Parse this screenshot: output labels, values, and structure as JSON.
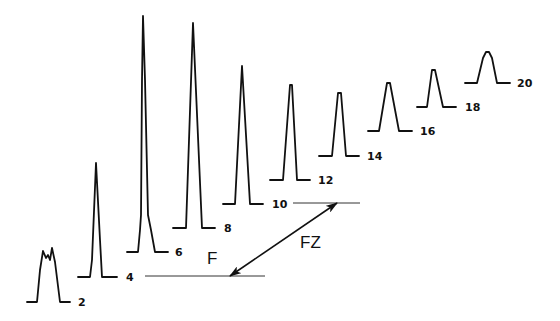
{
  "diagram": {
    "colors": {
      "ink": "#111111",
      "background": "#ffffff"
    },
    "peaks": [
      {
        "label": "2",
        "baseline_y": 302,
        "points": [
          [
            27,
            302
          ],
          [
            37,
            302
          ],
          [
            40,
            270
          ],
          [
            43,
            251
          ],
          [
            46,
            258
          ],
          [
            48,
            255
          ],
          [
            50,
            260
          ],
          [
            52,
            248
          ],
          [
            55,
            262
          ],
          [
            60,
            302
          ],
          [
            70,
            302
          ]
        ],
        "label_pos": [
          78,
          306
        ]
      },
      {
        "label": "4",
        "baseline_y": 277,
        "points": [
          [
            78,
            277
          ],
          [
            90,
            277
          ],
          [
            92,
            260
          ],
          [
            96,
            163
          ],
          [
            100,
            240
          ],
          [
            102,
            277
          ],
          [
            117,
            277
          ]
        ],
        "label_pos": [
          126,
          281
        ]
      },
      {
        "label": "6",
        "baseline_y": 252,
        "points": [
          [
            127,
            252
          ],
          [
            138,
            252
          ],
          [
            140,
            230
          ],
          [
            141,
            215
          ],
          [
            142,
            80
          ],
          [
            143,
            16
          ],
          [
            145,
            80
          ],
          [
            148,
            215
          ],
          [
            151,
            230
          ],
          [
            155,
            252
          ],
          [
            168,
            252
          ]
        ],
        "label_pos": [
          175,
          256
        ]
      },
      {
        "label": "8",
        "baseline_y": 228,
        "points": [
          [
            173,
            228
          ],
          [
            186,
            228
          ],
          [
            193,
            23
          ],
          [
            202,
            228
          ],
          [
            215,
            228
          ]
        ],
        "label_pos": [
          224,
          232
        ]
      },
      {
        "label": "10",
        "baseline_y": 204,
        "points": [
          [
            223,
            204
          ],
          [
            235,
            204
          ],
          [
            242,
            66
          ],
          [
            250,
            204
          ],
          [
            263,
            204
          ]
        ],
        "label_pos": [
          272,
          208
        ]
      },
      {
        "label": "12",
        "baseline_y": 180,
        "points": [
          [
            270,
            180
          ],
          [
            283,
            180
          ],
          [
            290,
            85
          ],
          [
            292,
            85
          ],
          [
            297,
            180
          ],
          [
            310,
            180
          ]
        ],
        "label_pos": [
          318,
          184
        ]
      },
      {
        "label": "14",
        "baseline_y": 156,
        "points": [
          [
            319,
            156
          ],
          [
            332,
            156
          ],
          [
            338,
            93
          ],
          [
            341,
            93
          ],
          [
            346,
            156
          ],
          [
            359,
            156
          ]
        ],
        "label_pos": [
          367,
          160
        ]
      },
      {
        "label": "16",
        "baseline_y": 131,
        "points": [
          [
            368,
            131
          ],
          [
            379,
            131
          ],
          [
            387,
            83
          ],
          [
            390,
            83
          ],
          [
            399,
            131
          ],
          [
            412,
            131
          ]
        ],
        "label_pos": [
          420,
          135
        ]
      },
      {
        "label": "18",
        "baseline_y": 107,
        "points": [
          [
            417,
            107
          ],
          [
            427,
            107
          ],
          [
            432,
            70
          ],
          [
            435,
            70
          ],
          [
            443,
            107
          ],
          [
            456,
            107
          ]
        ],
        "label_pos": [
          465,
          111
        ]
      },
      {
        "label": "20",
        "baseline_y": 83,
        "points": [
          [
            465,
            83
          ],
          [
            477,
            83
          ],
          [
            483,
            58
          ],
          [
            486,
            52
          ],
          [
            489,
            52
          ],
          [
            492,
            58
          ],
          [
            497,
            83
          ],
          [
            510,
            83
          ]
        ],
        "label_pos": [
          517,
          87
        ]
      }
    ],
    "guide_lines": [
      {
        "name": "lower-baseline-guide",
        "x1": 145,
        "y1": 276,
        "x2": 265,
        "y2": 276
      },
      {
        "name": "upper-baseline-guide",
        "x1": 293,
        "y1": 203,
        "x2": 360,
        "y2": 203
      }
    ],
    "arrow": {
      "label": "FZ",
      "x1": 230,
      "y1": 276,
      "x2": 337,
      "y2": 203,
      "label_pos": [
        300,
        248
      ],
      "double_headed": true
    },
    "annotation_f": {
      "label": "F",
      "pos": [
        207,
        264
      ]
    }
  }
}
